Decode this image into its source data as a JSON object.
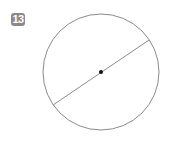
{
  "problem": {
    "number": "13",
    "badge_color": "#8a8a8a"
  },
  "figure": {
    "shape": "circle",
    "center": [
      101,
      72
    ],
    "radius": 58,
    "stroke_color": "#888888",
    "diameter": {
      "from": [
        53,
        105
      ],
      "to": [
        149,
        40
      ]
    },
    "center_point": true
  }
}
